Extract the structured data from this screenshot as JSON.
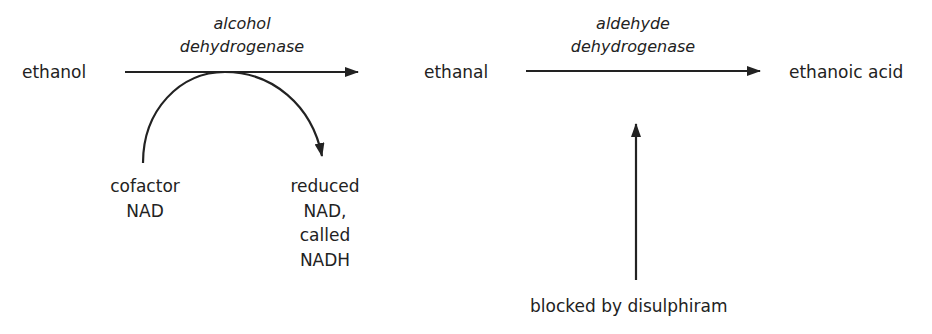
{
  "diagram": {
    "type": "metabolic-pathway",
    "nodes": {
      "ethanol": "ethanol",
      "ethanal": "ethanal",
      "ethanoic_acid": "ethanoic acid"
    },
    "enzymes": {
      "step1": {
        "line1": "alcohol",
        "line2": "dehydrogenase"
      },
      "step2": {
        "line1": "aldehyde",
        "line2": "dehydrogenase"
      }
    },
    "cofactor": {
      "line1": "cofactor",
      "line2": "NAD"
    },
    "reduced_cofactor": {
      "line1": "reduced",
      "line2": "NAD,",
      "line3": "called",
      "line4": "NADH"
    },
    "inhibitor": "blocked by disulphiram",
    "edges": [
      {
        "from": "ethanol",
        "to": "ethanal",
        "label": "alcohol dehydrogenase"
      },
      {
        "from": "ethanal",
        "to": "ethanoic acid",
        "label": "aldehyde dehydrogenase"
      },
      {
        "from": "cofactor NAD",
        "to": "reduced NAD, called NADH",
        "style": "curved",
        "via": "alcohol dehydrogenase"
      },
      {
        "from": "blocked by disulphiram",
        "to": "aldehyde dehydrogenase",
        "style": "vertical"
      }
    ],
    "colors": {
      "ink": "#222222",
      "background": "#ffffff"
    }
  }
}
